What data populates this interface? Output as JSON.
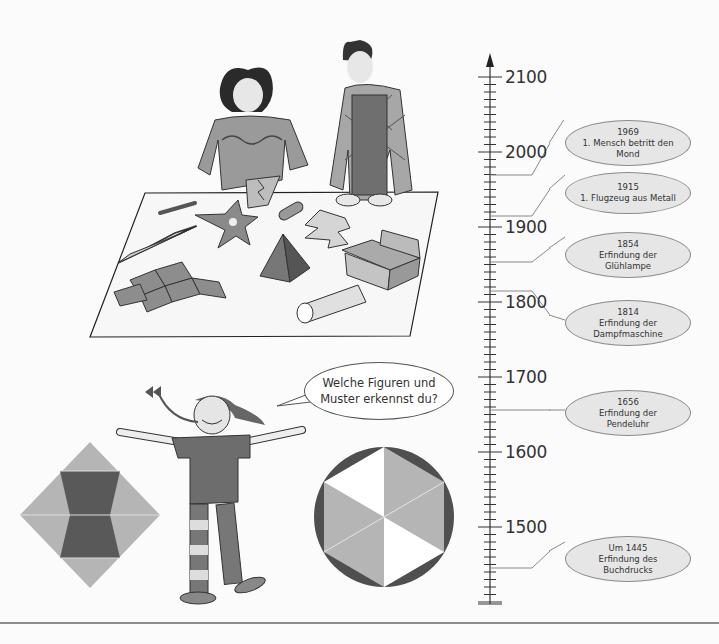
{
  "speech_bubble": {
    "line1": "Welche Figuren und",
    "line2": "Muster erkennst du?"
  },
  "timeline": {
    "axis_labels": [
      "2100",
      "2000",
      "1900",
      "1800",
      "1700",
      "1600",
      "1500"
    ],
    "events": [
      {
        "year": "1969",
        "line1": "1. Mensch betritt den",
        "line2": "Mond"
      },
      {
        "year": "1915",
        "line1": "1. Flugzeug aus Metall",
        "line2": ""
      },
      {
        "year": "1854",
        "line1": "Erfindung der",
        "line2": "Glühlampe"
      },
      {
        "year": "1814",
        "line1": "Erfindung der",
        "line2": "Dampfmaschine"
      },
      {
        "year": "1656",
        "line1": "Erfindung der",
        "line2": "Pendeluhr"
      },
      {
        "year": "Um 1445",
        "line1": "Erfindung des",
        "line2": "Buchdrucks"
      }
    ]
  },
  "illustrations": {
    "top": "children-cutting-paper-shapes",
    "bottom_left": "diamond-pattern",
    "bottom_center": "girl-with-open-arms",
    "bottom_right": "hexagon-in-circle"
  },
  "colors": {
    "light_gray": "#b5b5b5",
    "dark_gray": "#555555",
    "ellipse_fill": "#e6e6e6",
    "axis": "#333333"
  }
}
